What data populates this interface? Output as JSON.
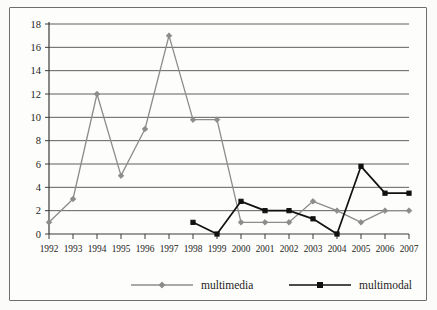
{
  "chart_data": {
    "type": "line",
    "title": "",
    "subtitle": "",
    "xlabel": "",
    "ylabel": "",
    "grid": true,
    "legend_position": "bottom",
    "xlim": [
      1992,
      2007
    ],
    "ylim": [
      0,
      18
    ],
    "ytick_step": 2,
    "categories": [
      "1992",
      "1993",
      "1994",
      "1995",
      "1996",
      "1997",
      "1998",
      "1999",
      "2000",
      "2001",
      "2002",
      "2003",
      "2004",
      "2005",
      "2006",
      "2007"
    ],
    "yticks": [
      "0",
      "2",
      "4",
      "6",
      "8",
      "10",
      "12",
      "14",
      "16",
      "18"
    ],
    "series": [
      {
        "name": "multimedia",
        "color": "#8c8c8c",
        "marker": "diamond",
        "x": [
          "1992",
          "1993",
          "1994",
          "1995",
          "1996",
          "1997",
          "1998",
          "1999",
          "2000",
          "2001",
          "2002",
          "2003",
          "2004",
          "2005",
          "2006",
          "2007"
        ],
        "values": [
          1,
          3,
          12,
          5,
          9,
          17,
          9.8,
          9.8,
          1,
          1,
          1,
          2.8,
          2,
          1,
          2,
          2
        ]
      },
      {
        "name": "multimodal",
        "color": "#111111",
        "marker": "square",
        "x": [
          "1998",
          "1999",
          "2000",
          "2001",
          "2002",
          "2003",
          "2004",
          "2005",
          "2006",
          "2007"
        ],
        "values": [
          1,
          0,
          2.8,
          2,
          2,
          1.3,
          0,
          5.8,
          3.5,
          3.5
        ]
      }
    ]
  },
  "legend": {
    "items": [
      {
        "label": "multimedia",
        "color": "#8c8c8c",
        "marker": "diamond"
      },
      {
        "label": "multimodal",
        "color": "#111111",
        "marker": "square"
      }
    ]
  },
  "axes": {
    "y_axis_name": "y-axis",
    "x_axis_name": "x-axis"
  }
}
